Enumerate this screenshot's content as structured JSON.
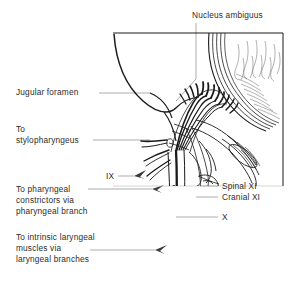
{
  "figure": {
    "stroke_color": "#1a1a1a",
    "leader_color": "#8a8a8a",
    "text_color": "#2c2c2c",
    "background": "#ffffff"
  },
  "labels": {
    "nucleus_ambiguus": "Nucleus ambiguus",
    "jugular_foramen": "Jugular foramen",
    "to_stylopharyngeus_l1": "To",
    "to_stylopharyngeus_l2": "stylopharyngeus",
    "nerve_ix": "IX",
    "to_pharyngeal_l1": "To pharyngeal",
    "to_pharyngeal_l2": "constrictors via",
    "to_pharyngeal_l3": "pharyngeal branch",
    "to_laryngeal_l1": "To intrinsic laryngeal",
    "to_laryngeal_l2": "muscles via",
    "to_laryngeal_l3": "laryngeal branches",
    "spinal_xi": "Spinal XI",
    "cranial_xi": "Cranial XI",
    "nerve_x": "X"
  }
}
